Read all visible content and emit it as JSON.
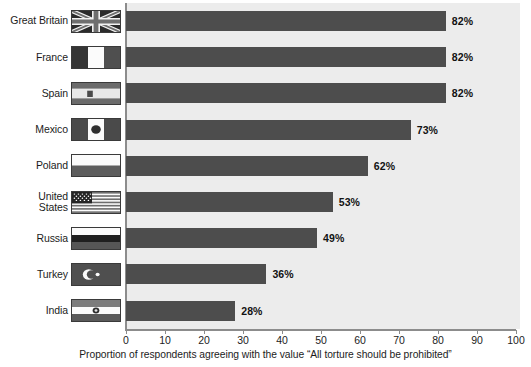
{
  "chart_data": {
    "type": "bar",
    "orientation": "horizontal",
    "title": "",
    "xlabel": "Proportion of respondents agreeing with the value “All torture should be prohibited”",
    "ylabel": "",
    "xlim": [
      0,
      100
    ],
    "xticks": [
      0,
      10,
      20,
      30,
      40,
      50,
      60,
      70,
      80,
      90,
      100
    ],
    "xtick_labels": [
      "0",
      "10",
      "20",
      "30",
      "40",
      "50",
      "60",
      "70",
      "80",
      "90",
      "100"
    ],
    "grid": false,
    "legend": "none",
    "bar_color": "#4d4d4d",
    "plot_background": "#ececec",
    "axis_color": "#8c8c8c",
    "categories": [
      "Great Britain",
      "France",
      "Spain",
      "Mexico",
      "Poland",
      "United\nStates",
      "Russia",
      "Turkey",
      "India"
    ],
    "values": [
      82,
      82,
      82,
      73,
      62,
      53,
      49,
      36,
      28
    ],
    "value_labels": [
      "82%",
      "82%",
      "82%",
      "73%",
      "62%",
      "53%",
      "49%",
      "36%",
      "28%"
    ],
    "flags": [
      "flag-great-britain",
      "flag-france",
      "flag-spain",
      "flag-mexico",
      "flag-poland",
      "flag-united-states",
      "flag-russia",
      "flag-turkey",
      "flag-india"
    ]
  }
}
